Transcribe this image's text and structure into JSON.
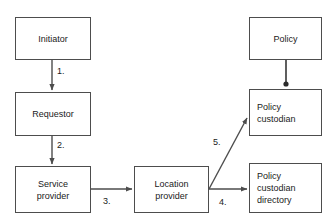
{
  "diagram": {
    "type": "flowchart",
    "canvas": {
      "width": 334,
      "height": 220
    },
    "style": {
      "background": "#ffffff",
      "box_border_color": "#4d4d4d",
      "box_fill_color": "#ffffff",
      "edge_color": "#4d4d4d",
      "text_color": "#1a1a1a"
    },
    "nodes": [
      {
        "id": "initiator",
        "lines": [
          "Initiator"
        ],
        "align": "center",
        "x": 15,
        "y": 17,
        "w": 76,
        "h": 43
      },
      {
        "id": "requestor",
        "lines": [
          "Requestor"
        ],
        "align": "center",
        "x": 15,
        "y": 92,
        "w": 76,
        "h": 44
      },
      {
        "id": "service-provider",
        "lines": [
          "Service",
          "provider"
        ],
        "align": "center",
        "x": 15,
        "y": 166,
        "w": 76,
        "h": 47
      },
      {
        "id": "location-provider",
        "lines": [
          "Location",
          "provider"
        ],
        "align": "center",
        "x": 134,
        "y": 166,
        "w": 75,
        "h": 47
      },
      {
        "id": "policy",
        "lines": [
          "Policy"
        ],
        "align": "center",
        "x": 249,
        "y": 17,
        "w": 73,
        "h": 43
      },
      {
        "id": "policy-custodian",
        "lines": [
          "Policy",
          "custodian"
        ],
        "align": "left",
        "x": 249,
        "y": 89,
        "w": 73,
        "h": 47
      },
      {
        "id": "policy-custodian-directory",
        "lines": [
          "Policy",
          "custodian",
          "directory"
        ],
        "align": "left",
        "x": 249,
        "y": 163,
        "w": 73,
        "h": 50
      }
    ],
    "edges": [
      {
        "id": "initiator-to-requestor",
        "from": "initiator",
        "to": "requestor",
        "label": "1.",
        "label_x": 57,
        "label_y": 66
      },
      {
        "id": "requestor-to-service-provider",
        "from": "requestor",
        "to": "service-provider",
        "label": "2.",
        "label_x": 57,
        "label_y": 140
      },
      {
        "id": "service-provider-to-location-provider",
        "from": "service-provider",
        "to": "location-provider",
        "label": "3.",
        "label_x": 103,
        "label_y": 196
      },
      {
        "id": "location-provider-to-policy-custodian-directory",
        "from": "location-provider",
        "to": "policy-custodian-directory",
        "label": "4.",
        "label_x": 219,
        "label_y": 197
      },
      {
        "id": "location-provider-to-policy-custodian",
        "from": "location-provider",
        "to": "policy-custodian",
        "label": "5.",
        "label_x": 213,
        "label_y": 137
      },
      {
        "id": "policy-to-policy-custodian",
        "from": "policy",
        "to": "policy-custodian",
        "label": "",
        "label_x": 0,
        "label_y": 0
      }
    ]
  }
}
